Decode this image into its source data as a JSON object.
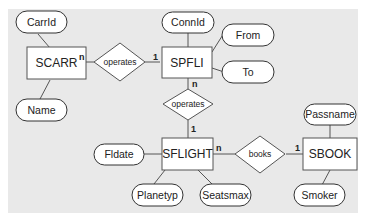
{
  "diagram": {
    "type": "entity-relationship",
    "entities": [
      {
        "id": "scarr",
        "label": "SCARR"
      },
      {
        "id": "spfli",
        "label": "SPFLI"
      },
      {
        "id": "sflight",
        "label": "SFLIGHT"
      },
      {
        "id": "sbook",
        "label": "SBOOK"
      }
    ],
    "attributes": [
      {
        "id": "carrid",
        "label": "CarrId",
        "entity": "scarr"
      },
      {
        "id": "name",
        "label": "Name",
        "entity": "scarr"
      },
      {
        "id": "connid",
        "label": "ConnId",
        "entity": "spfli"
      },
      {
        "id": "from",
        "label": "From",
        "entity": "spfli"
      },
      {
        "id": "to",
        "label": "To",
        "entity": "spfli"
      },
      {
        "id": "fldate",
        "label": "Fldate",
        "entity": "sflight"
      },
      {
        "id": "planetyp",
        "label": "Planetyp",
        "entity": "sflight"
      },
      {
        "id": "seatsmax",
        "label": "Seatsmax",
        "entity": "sflight"
      },
      {
        "id": "passname",
        "label": "Passname",
        "entity": "sbook"
      },
      {
        "id": "smoker",
        "label": "Smoker",
        "entity": "sbook"
      }
    ],
    "relationships": [
      {
        "id": "rel1",
        "label": "operates",
        "from": "scarr",
        "to": "spfli",
        "from_card": "n",
        "to_card": "1"
      },
      {
        "id": "rel2",
        "label": "operates",
        "from": "spfli",
        "to": "sflight",
        "from_card": "n",
        "to_card": "1"
      },
      {
        "id": "rel3",
        "label": "books",
        "from": "sflight",
        "to": "sbook",
        "from_card": "n",
        "to_card": "1"
      }
    ]
  }
}
